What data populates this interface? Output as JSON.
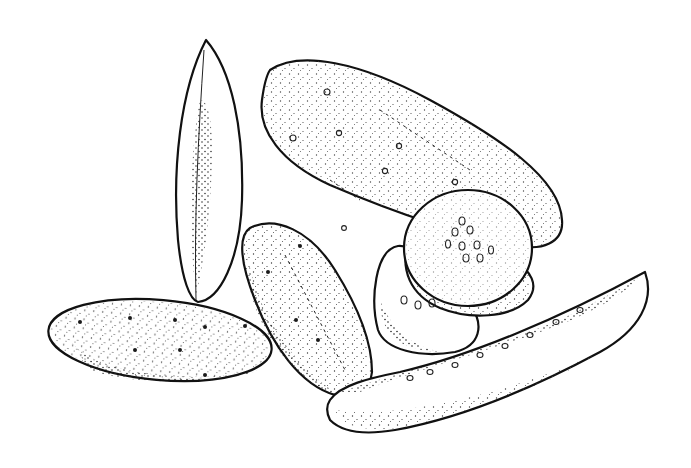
{
  "illustration": {
    "subject": "pickles",
    "style": "black and white stippled line drawing",
    "background": "#ffffff",
    "ink": "#111111",
    "elements": [
      {
        "id": "vertical-spear",
        "kind": "pickle-spear",
        "cx": 208,
        "cy": 168,
        "rx": 32,
        "ry": 130,
        "rotate": 3
      },
      {
        "id": "small-gherkin",
        "kind": "whole-pickle",
        "cx": 160,
        "cy": 338,
        "rx": 112,
        "ry": 40,
        "rotate": 5
      },
      {
        "id": "tilted-gherkin",
        "kind": "whole-pickle",
        "cx": 302,
        "cy": 312,
        "rx": 55,
        "ry": 100,
        "rotate": -24
      },
      {
        "id": "large-pickle",
        "kind": "whole-pickle",
        "cx": 410,
        "cy": 158,
        "rx": 158,
        "ry": 72,
        "rotate": 24
      },
      {
        "id": "slice-back",
        "kind": "pickle-slice",
        "cx": 425,
        "cy": 300,
        "rx": 56,
        "ry": 56
      },
      {
        "id": "slice-middle",
        "kind": "pickle-slice",
        "cx": 455,
        "cy": 285,
        "rx": 57,
        "ry": 50
      },
      {
        "id": "slice-front",
        "kind": "pickle-slice",
        "cx": 468,
        "cy": 250,
        "rx": 62,
        "ry": 62
      },
      {
        "id": "curved-spear",
        "kind": "pickle-spear",
        "path": "M330 430 C 300 400 340 385 380 378 C 470 360 560 320 645 272 C 655 300 640 330 600 352 C 520 395 450 420 390 428 C 360 432 345 436 330 430 Z"
      }
    ]
  }
}
